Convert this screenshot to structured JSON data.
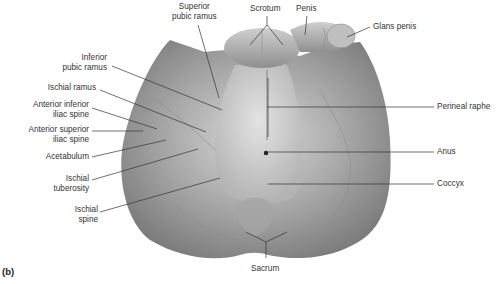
{
  "figure": {
    "panel_label": "(b)",
    "colors": {
      "body": "#9a9a9a",
      "leader": "#333333",
      "text": "#333333",
      "highlight": "#d4d4d4"
    }
  },
  "labels": {
    "superior_pubic_ramus": [
      "Superior",
      "pubic ramus"
    ],
    "scrotum": "Scrotum",
    "penis": "Penis",
    "glans_penis": "Glans penis",
    "inferior_pubic_ramus": [
      "Inferior",
      "pubic ramus"
    ],
    "ischial_ramus": "Ischial ramus",
    "anterior_inferior_iliac_spine": [
      "Anterior inferior",
      "iliac spine"
    ],
    "anterior_superior_iliac_spine": [
      "Anterior superior",
      "iliac spine"
    ],
    "acetabulum": "Acetabulum",
    "ischial_tuberosity": [
      "Ischial",
      "tuberosity"
    ],
    "ischial_spine": [
      "Ischial",
      "spine"
    ],
    "perineal_raphe": "Perineal raphe",
    "anus": "Anus",
    "coccyx": "Coccyx",
    "sacrum": "Sacrum"
  }
}
